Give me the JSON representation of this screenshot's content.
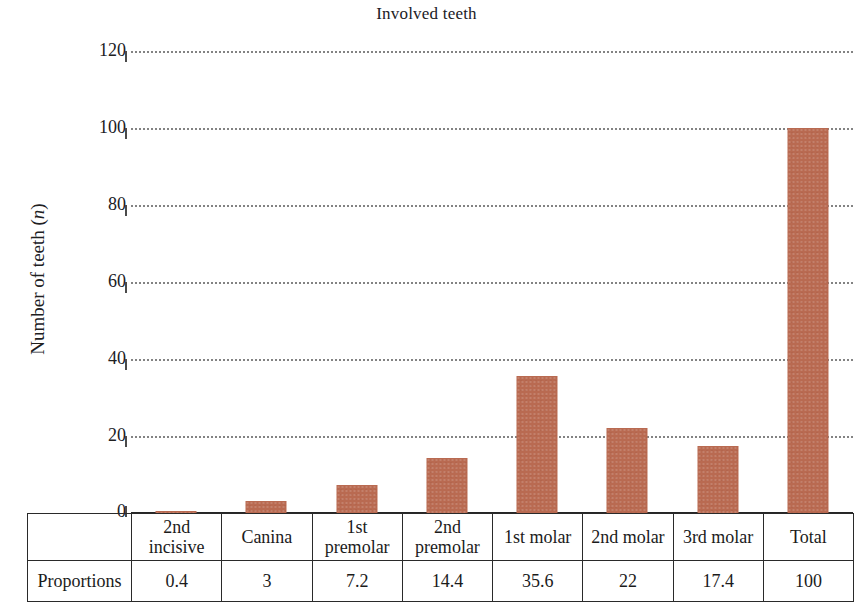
{
  "chart_data": {
    "type": "bar",
    "title": "Involved teeth",
    "xlabel": "",
    "ylabel": "Number of teeth (n)",
    "ylim": [
      0,
      120
    ],
    "yticks": [
      0,
      20,
      40,
      60,
      80,
      100,
      120
    ],
    "grid": true,
    "legend": "none",
    "bar_color": "#b96a51",
    "categories": [
      "2nd incisive",
      "Canina",
      "1st premolar",
      "2nd premolar",
      "1st molar",
      "2nd molar",
      "3rd molar",
      "Total"
    ],
    "values": [
      0.4,
      3,
      7.2,
      14.4,
      35.6,
      22,
      17.4,
      100
    ],
    "series": [
      {
        "name": "Number of teeth (n)",
        "values": [
          0.4,
          3,
          7.2,
          14.4,
          35.6,
          22,
          17.4,
          100
        ]
      }
    ],
    "table": {
      "row_header": "Proportions",
      "values": [
        "0.4",
        "3",
        "7.2",
        "14.4",
        "35.6",
        "22",
        "17.4",
        "100"
      ]
    }
  },
  "axis": {
    "y_label_main": "Number of teeth (",
    "y_label_italic": "n",
    "y_label_close": ")",
    "ticks": {
      "t0": "0",
      "t1": "20",
      "t2": "40",
      "t3": "60",
      "t4": "80",
      "t5": "100",
      "t6": "120"
    }
  },
  "category_labels": {
    "c0_line1": "2nd",
    "c0_line2": "incisive",
    "c1_line1": "Canina",
    "c1_line2": "",
    "c2_line1": "1st",
    "c2_line2": "premolar",
    "c3_line1": "2nd",
    "c3_line2": "premolar",
    "c4_line1": "1st molar",
    "c4_line2": "",
    "c5_line1": "2nd molar",
    "c5_line2": "",
    "c6_line1": "3rd molar",
    "c6_line2": "",
    "c7_line1": "Total",
    "c7_line2": ""
  }
}
